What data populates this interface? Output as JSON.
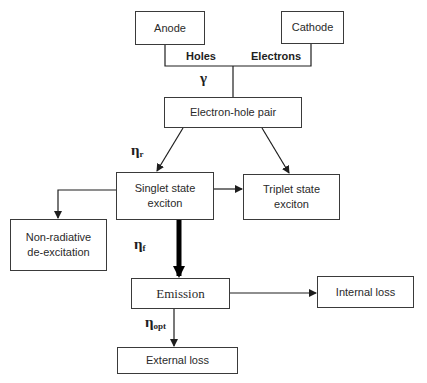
{
  "diagram": {
    "nodes": {
      "anode": "Anode",
      "cathode": "Cathode",
      "pair": "Electron-hole pair",
      "singlet_line1": "Singlet state",
      "singlet_line2": "exciton",
      "triplet_line1": "Triplet state",
      "triplet_line2": "exciton",
      "nonrad_line1": "Non-radiative",
      "nonrad_line2": "de-excitation",
      "emission": "Emission",
      "internal": "Internal loss",
      "external": "External loss"
    },
    "edge_labels": {
      "holes": "Holes",
      "electrons": "Electrons",
      "gamma": "γ",
      "eta_r_symbol": "η",
      "eta_r_sub": "r",
      "eta_f_symbol": "η",
      "eta_f_sub": "f",
      "eta_opt_symbol": "η",
      "eta_opt_sub": "opt"
    },
    "colors": {
      "line": "#1e1e1e",
      "box_border": "#3a3a3a",
      "background": "#ffffff"
    }
  }
}
